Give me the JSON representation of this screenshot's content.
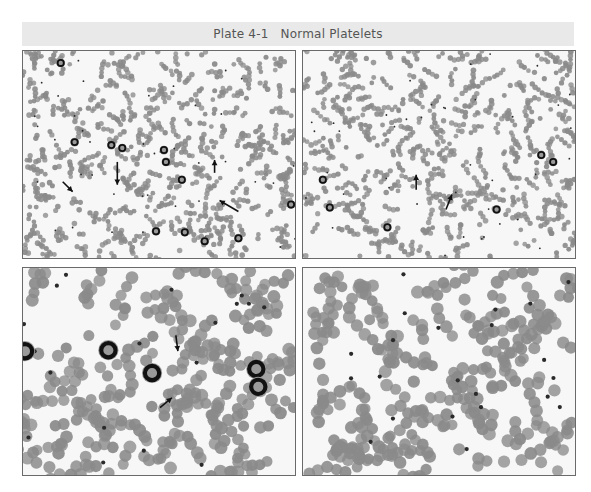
{
  "plate": {
    "number": "Plate 4-1",
    "title": "Normal Platelets"
  },
  "colors": {
    "title_bg": "#e9e9e9",
    "title_text": "#555555",
    "panel_border": "#6a6a6a",
    "panel_bg": "#f7f7f7",
    "rbc": "#8a8a8a",
    "platelet": "#2a2a2a",
    "wbc_nucleus": "#111111",
    "arrow": "#111111"
  },
  "panels": [
    {
      "id": "p-tl",
      "name": "low-magnification-smear-left",
      "magnification": "low",
      "seed": 11,
      "rbc_count": 900,
      "rbc_radius": 2.6,
      "platelet_count": 40,
      "wbc": [
        [
          38,
          12
        ],
        [
          52,
          92
        ],
        [
          89,
          95
        ],
        [
          100,
          98
        ],
        [
          142,
          100
        ],
        [
          144,
          112
        ],
        [
          160,
          130
        ],
        [
          134,
          182
        ],
        [
          163,
          183
        ],
        [
          183,
          192
        ],
        [
          217,
          189
        ],
        [
          270,
          155
        ]
      ],
      "arrows": [
        [
          40,
          132,
          50,
          142
        ],
        [
          95,
          112,
          95,
          135
        ],
        [
          193,
          123,
          193,
          110
        ],
        [
          217,
          162,
          198,
          151
        ]
      ]
    },
    {
      "id": "p-tr",
      "name": "low-magnification-smear-right",
      "magnification": "low",
      "seed": 23,
      "rbc_count": 900,
      "rbc_radius": 2.6,
      "platelet_count": 40,
      "wbc": [
        [
          20,
          130
        ],
        [
          27,
          158
        ],
        [
          240,
          105
        ],
        [
          252,
          112
        ],
        [
          195,
          160
        ],
        [
          85,
          178
        ]
      ],
      "arrows": [
        [
          114,
          140,
          114,
          125
        ],
        [
          144,
          160,
          150,
          145
        ]
      ]
    },
    {
      "id": "p-bl",
      "name": "high-magnification-smear-left",
      "magnification": "high",
      "seed": 37,
      "rbc_count": 330,
      "rbc_radius": 6,
      "platelet_count": 18,
      "wbc": [
        [
          2,
          84
        ],
        [
          86,
          83
        ],
        [
          130,
          106
        ],
        [
          235,
          102
        ],
        [
          237,
          120
        ]
      ],
      "arrows": [
        [
          154,
          68,
          156,
          84
        ],
        [
          138,
          141,
          150,
          131
        ]
      ]
    },
    {
      "id": "p-br",
      "name": "high-magnification-smear-right",
      "magnification": "high",
      "seed": 53,
      "rbc_count": 330,
      "rbc_radius": 6,
      "platelet_count": 22,
      "wbc": [],
      "arrows": []
    }
  ]
}
